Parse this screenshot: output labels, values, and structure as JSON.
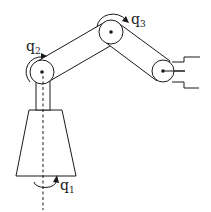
{
  "diagram": {
    "joints": [
      {
        "id": "q1",
        "label": "q",
        "subscript": "1",
        "description": "base rotation about vertical axis"
      },
      {
        "id": "q2",
        "label": "q",
        "subscript": "2",
        "description": "shoulder joint"
      },
      {
        "id": "q3",
        "label": "q",
        "subscript": "3",
        "description": "elbow joint"
      }
    ],
    "components": [
      "base",
      "column",
      "upper-link",
      "forearm-link",
      "wrist-joint",
      "gripper"
    ],
    "colors": {
      "stroke": "#1a1a1a",
      "background": "#ffffff"
    }
  }
}
